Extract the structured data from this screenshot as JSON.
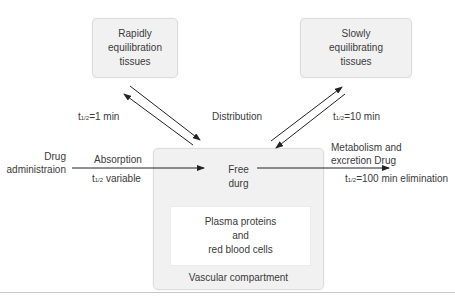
{
  "diagram": {
    "rapid_box": {
      "lines": [
        "Rapidly",
        "equilibration",
        "tissues"
      ]
    },
    "slow_box": {
      "lines": [
        "Slowly",
        "equilibrating",
        "tissues"
      ]
    },
    "central": {
      "free_drug": [
        "Free",
        "durg"
      ],
      "plasma": [
        "Plasma proteins",
        "and",
        "red blood cells"
      ],
      "compartment_label": "Vascular compartment"
    },
    "labels": {
      "rapid_half_life_prefix": "t",
      "rapid_half_life_sub": "1/2",
      "rapid_half_life_value": "=1 min",
      "distribution": "Distribution",
      "slow_half_life_prefix": "t",
      "slow_half_life_sub": "1/2",
      "slow_half_life_value": "=10 min",
      "drug_admin": [
        "Drug",
        "administraion"
      ],
      "absorption": "Absorption",
      "absorption_half_life_prefix": "t",
      "absorption_half_life_sub": "1/2",
      "absorption_half_life_value": " variable",
      "metabolism": [
        "Metabolism and",
        "excretion Drug"
      ],
      "elimination_prefix": "t",
      "elimination_sub": "1/2",
      "elimination_value": "=100 min elimination"
    },
    "colors": {
      "box_fill": "#f1f1f1",
      "inner_fill": "#ffffff",
      "arrow": "#222222",
      "text": "#3a3a3a"
    }
  }
}
